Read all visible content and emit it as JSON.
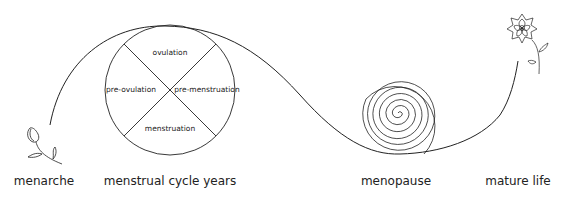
{
  "diagram": {
    "stages": [
      {
        "id": "menarche",
        "label": "menarche",
        "icon": "flower-bud-icon"
      },
      {
        "id": "menstrual-cycle-years",
        "label": "menstrual cycle years",
        "icon": "cycle-circle"
      },
      {
        "id": "menopause",
        "label": "menopause",
        "icon": "spiral-icon"
      },
      {
        "id": "mature-life",
        "label": "mature life",
        "icon": "blooming-flower-icon"
      }
    ],
    "cycle_segments": {
      "top": "ovulation",
      "left": "pre-ovulation",
      "right": "pre-menstruation",
      "bottom": "menstruation"
    },
    "colors": {
      "line": "#222222",
      "background": "#ffffff",
      "text": "#222222"
    }
  }
}
